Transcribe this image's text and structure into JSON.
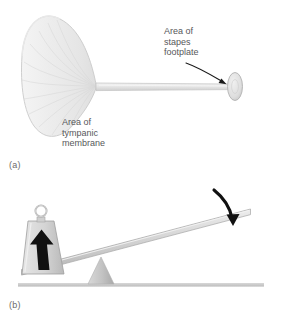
{
  "figure": {
    "background_color": "#ffffff",
    "width": 282,
    "height": 323
  },
  "panels": [
    {
      "id": "a",
      "panel_label": "(a)",
      "description": "Cone-shaped tympanic membrane connected by a rod to a small stapes footplate disc",
      "annotations": [
        {
          "name": "stapes-footplate-label",
          "lines": [
            "Area of",
            "stapes",
            "footplate"
          ],
          "pointer": "curved-arrow-down-right"
        },
        {
          "name": "tympanic-membrane-label",
          "lines": [
            "Area of",
            "tympanic",
            "membrane"
          ],
          "pointer": "none"
        }
      ],
      "shapes": {
        "cone_name": "tympanic-membrane-cone",
        "rod_name": "connecting-rod",
        "disc_name": "stapes-footplate-disc"
      }
    },
    {
      "id": "b",
      "panel_label": "(b)",
      "description": "Lever resting on a triangular fulcrum with a weight at the short left end and a downward force arrow at the long right end",
      "annotations": [],
      "shapes": {
        "beam_name": "lever-beam",
        "fulcrum_name": "fulcrum-triangle",
        "weight_name": "weight-block",
        "ring_name": "weight-ring-handle",
        "ground_name": "ground-line",
        "force_arrow_name": "applied-force-arrow",
        "reaction_arrow_name": "lifting-force-arrow"
      }
    }
  ],
  "colors": {
    "background": "#ffffff",
    "membrane_fill": "#eeeeee",
    "membrane_stroke": "#c9c9c9",
    "rod_fill": "#e3e3e3",
    "rod_stroke": "#c0c0c0",
    "disc_fill": "#dcdcdc",
    "disc_stroke": "#b5b5b5",
    "beam_fill": "#d2d2d2",
    "beam_stroke": "#a8a8a8",
    "fulcrum_fill": "#c4c4c4",
    "weight_fill": "#d8d8d8",
    "weight_stroke": "#9e9e9e",
    "ground_fill": "#d0d0d0",
    "arrow_black": "#111111",
    "text_gray": "#57585a",
    "caption_gray": "#6b6b6b"
  }
}
